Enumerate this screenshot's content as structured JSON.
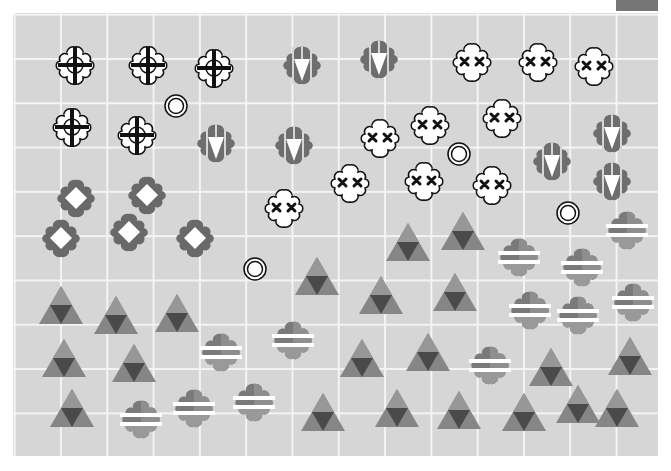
{
  "board": {
    "columns": 14,
    "rows": 10,
    "background": "#d6d6d6",
    "grid_line_color": "#f4f4f4"
  },
  "corner_tab": {
    "color": "#767676"
  },
  "pieces": {
    "crosshair_clouds": [
      {
        "x": 75,
        "y": 65
      },
      {
        "x": 148,
        "y": 65
      },
      {
        "x": 214,
        "y": 68
      },
      {
        "x": 72,
        "y": 127
      },
      {
        "x": 137,
        "y": 135
      }
    ],
    "targets": [
      {
        "x": 176,
        "y": 106
      },
      {
        "x": 459,
        "y": 154
      },
      {
        "x": 568,
        "y": 213
      },
      {
        "x": 255,
        "y": 269
      }
    ],
    "arrow_shields": [
      {
        "x": 302,
        "y": 65
      },
      {
        "x": 379,
        "y": 59
      },
      {
        "x": 216,
        "y": 143
      },
      {
        "x": 294,
        "y": 145
      },
      {
        "x": 552,
        "y": 161
      },
      {
        "x": 612,
        "y": 133
      },
      {
        "x": 612,
        "y": 181
      }
    ],
    "xx_clouds": [
      {
        "x": 472,
        "y": 62
      },
      {
        "x": 538,
        "y": 62
      },
      {
        "x": 594,
        "y": 66
      },
      {
        "x": 380,
        "y": 138
      },
      {
        "x": 430,
        "y": 125
      },
      {
        "x": 502,
        "y": 118
      },
      {
        "x": 350,
        "y": 183
      },
      {
        "x": 424,
        "y": 181
      },
      {
        "x": 492,
        "y": 185
      },
      {
        "x": 284,
        "y": 208
      }
    ],
    "diamond_flowers": [
      {
        "x": 76,
        "y": 198
      },
      {
        "x": 147,
        "y": 195
      },
      {
        "x": 61,
        "y": 238
      },
      {
        "x": 129,
        "y": 232
      },
      {
        "x": 195,
        "y": 238
      }
    ],
    "triangles": [
      {
        "x": 408,
        "y": 242
      },
      {
        "x": 463,
        "y": 231
      },
      {
        "x": 317,
        "y": 276
      },
      {
        "x": 381,
        "y": 295
      },
      {
        "x": 455,
        "y": 292
      },
      {
        "x": 61,
        "y": 305
      },
      {
        "x": 116,
        "y": 315
      },
      {
        "x": 177,
        "y": 313
      },
      {
        "x": 64,
        "y": 358
      },
      {
        "x": 134,
        "y": 363
      },
      {
        "x": 362,
        "y": 358
      },
      {
        "x": 428,
        "y": 352
      },
      {
        "x": 551,
        "y": 367
      },
      {
        "x": 630,
        "y": 356
      },
      {
        "x": 72,
        "y": 408
      },
      {
        "x": 323,
        "y": 412
      },
      {
        "x": 397,
        "y": 408
      },
      {
        "x": 459,
        "y": 410
      },
      {
        "x": 524,
        "y": 412
      },
      {
        "x": 578,
        "y": 404
      },
      {
        "x": 617,
        "y": 408
      }
    ],
    "striped_clouds": [
      {
        "x": 627,
        "y": 230
      },
      {
        "x": 519,
        "y": 257
      },
      {
        "x": 582,
        "y": 267
      },
      {
        "x": 530,
        "y": 310
      },
      {
        "x": 578,
        "y": 315
      },
      {
        "x": 633,
        "y": 302
      },
      {
        "x": 221,
        "y": 352
      },
      {
        "x": 293,
        "y": 340
      },
      {
        "x": 490,
        "y": 365
      },
      {
        "x": 141,
        "y": 419
      },
      {
        "x": 194,
        "y": 408
      },
      {
        "x": 254,
        "y": 402
      }
    ]
  },
  "colors": {
    "piece_dark": "#6a6a6a",
    "piece_mid": "#8a8a8a",
    "piece_light": "#9c9c9c",
    "triangle_inner": "#4a4a4a",
    "outline": "#111111",
    "white": "#ffffff"
  }
}
